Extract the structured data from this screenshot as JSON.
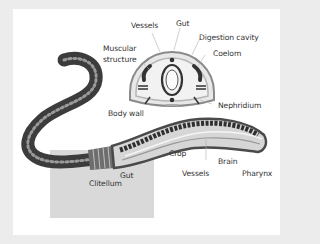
{
  "diagram": {
    "cross_section_labels": {
      "vessels_top": "Vessels",
      "gut_top": "Gut",
      "digestion_cavity": "Digestion cavity",
      "muscular_line1": "Muscular",
      "muscular_line2": "structure",
      "coelom": "Coelom",
      "nephridium": "Nephridium",
      "body_wall": "Body wall"
    },
    "body_labels": {
      "crop": "Crop",
      "brain": "Brain",
      "vessels_bottom": "Vessels",
      "pharynx": "Pharynx",
      "gut_bottom": "Gut",
      "clitellum": "Clitellum"
    },
    "colors": {
      "frame": "#ececec",
      "panel": "#ffffff",
      "backdrop": "#d9d9d9",
      "worm_dark": "#4a4a4a",
      "worm_ring": "#9a9a9a",
      "section_outer": "#8a8a8a",
      "section_fill": "#e8e8e8",
      "label_text": "#333333"
    }
  }
}
